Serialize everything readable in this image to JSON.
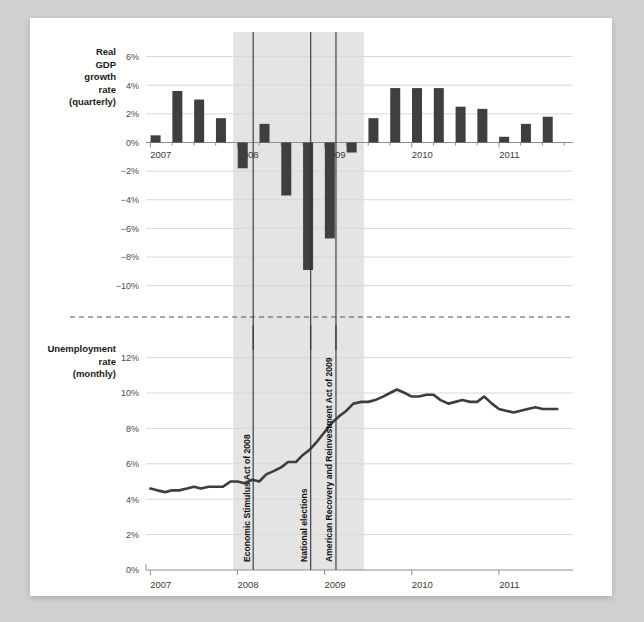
{
  "figure": {
    "background_color": "#cfd0d1",
    "paper_color": "#ffffff",
    "bar_color": "#3f3f41",
    "line_color": "#3d3d3f",
    "shade_color": "#e4e4e4",
    "grid_color": "#d8d8d8",
    "axis_color": "#9a9a9a",
    "divider_style": "dashed"
  },
  "annotations": {
    "events": [
      {
        "label": "Economic Stimulus Act of 2008",
        "x_year": 2008.18
      },
      {
        "label": "National elections",
        "x_year": 2008.84
      },
      {
        "label": "American Recovery and Reinvestment Act of 2009",
        "x_year": 2009.13
      }
    ],
    "recession_band": {
      "start_year": 2007.95,
      "end_year": 2009.45
    }
  },
  "chart_data": [
    {
      "type": "bar",
      "id": "gdp",
      "title": "",
      "ylabel": "Real GDP growth rate (quarterly)",
      "ylabel_lines": [
        "Real",
        "GDP",
        "growth",
        "rate",
        "(quarterly)"
      ],
      "xlabel": "",
      "ylim": [
        -11,
        6.6
      ],
      "yticks": [
        6,
        4,
        2,
        0,
        -2,
        -4,
        -6,
        -8,
        -10
      ],
      "ytick_labels": [
        "6%",
        "4%",
        "2%",
        "0%",
        "−2%",
        "−4%",
        "−6%",
        "−8%",
        "−10%"
      ],
      "xlim": [
        2006.95,
        2011.85
      ],
      "xticks": [
        2007,
        2008,
        2009,
        2010,
        2011
      ],
      "xtick_labels": [
        "2007",
        "2008",
        "2009",
        "2010",
        "2011"
      ],
      "grid": true,
      "categories": [
        "2007 Q1",
        "2007 Q2",
        "2007 Q3",
        "2007 Q4",
        "2008 Q1",
        "2008 Q2",
        "2008 Q3",
        "2008 Q4",
        "2009 Q1",
        "2009 Q2",
        "2009 Q3",
        "2009 Q4",
        "2010 Q1",
        "2010 Q2",
        "2010 Q3",
        "2010 Q4",
        "2011 Q1",
        "2011 Q2",
        "2011 Q3"
      ],
      "x": [
        2007.06,
        2007.31,
        2007.56,
        2007.81,
        2008.06,
        2008.31,
        2008.56,
        2008.81,
        2009.06,
        2009.31,
        2009.56,
        2009.81,
        2010.06,
        2010.31,
        2010.56,
        2010.81,
        2011.06,
        2011.31,
        2011.56
      ],
      "values": [
        0.5,
        3.6,
        3.0,
        1.7,
        -1.8,
        1.3,
        -3.7,
        -8.9,
        -6.7,
        -0.7,
        1.7,
        3.8,
        3.8,
        3.8,
        2.5,
        2.35,
        0.4,
        1.3,
        1.8
      ]
    },
    {
      "type": "line",
      "id": "unemployment",
      "title": "",
      "ylabel": "Unemployment rate (monthly)",
      "ylabel_lines": [
        "Unemployment",
        "rate",
        "(monthly)"
      ],
      "xlabel": "",
      "ylim": [
        0,
        12.6
      ],
      "yticks": [
        12,
        10,
        8,
        6,
        4,
        2,
        0
      ],
      "ytick_labels": [
        "12%",
        "10%",
        "8%",
        "6%",
        "4%",
        "2%",
        "0%"
      ],
      "xlim": [
        2006.95,
        2011.85
      ],
      "xticks": [
        2007,
        2008,
        2009,
        2010,
        2011
      ],
      "xtick_labels": [
        "2007",
        "2008",
        "2009",
        "2010",
        "2011"
      ],
      "grid": true,
      "x": [
        2007.0,
        2007.08,
        2007.17,
        2007.25,
        2007.33,
        2007.42,
        2007.5,
        2007.58,
        2007.67,
        2007.75,
        2007.83,
        2007.92,
        2008.0,
        2008.08,
        2008.17,
        2008.25,
        2008.33,
        2008.42,
        2008.5,
        2008.58,
        2008.67,
        2008.75,
        2008.83,
        2008.92,
        2009.0,
        2009.08,
        2009.17,
        2009.25,
        2009.33,
        2009.42,
        2009.5,
        2009.58,
        2009.67,
        2009.75,
        2009.83,
        2009.92,
        2010.0,
        2010.08,
        2010.17,
        2010.25,
        2010.33,
        2010.42,
        2010.5,
        2010.58,
        2010.67,
        2010.75,
        2010.83,
        2010.92,
        2011.0,
        2011.08,
        2011.17,
        2011.25,
        2011.33,
        2011.42,
        2011.5,
        2011.58,
        2011.67
      ],
      "values": [
        4.6,
        4.5,
        4.4,
        4.5,
        4.5,
        4.6,
        4.7,
        4.6,
        4.7,
        4.7,
        4.7,
        5.0,
        5.0,
        4.9,
        5.1,
        5.0,
        5.4,
        5.6,
        5.8,
        6.1,
        6.1,
        6.5,
        6.8,
        7.3,
        7.8,
        8.3,
        8.7,
        9.0,
        9.4,
        9.5,
        9.5,
        9.6,
        9.8,
        10.0,
        10.2,
        10.0,
        9.8,
        9.8,
        9.9,
        9.9,
        9.6,
        9.4,
        9.5,
        9.6,
        9.5,
        9.5,
        9.8,
        9.4,
        9.1,
        9.0,
        8.9,
        9.0,
        9.1,
        9.2,
        9.1,
        9.1,
        9.1
      ]
    }
  ]
}
